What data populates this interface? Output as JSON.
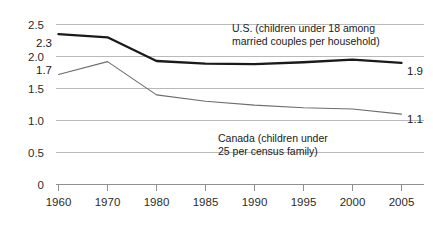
{
  "chart_data": {
    "type": "line",
    "title": "",
    "xlabel": "",
    "ylabel": "",
    "grid": true,
    "legend_position": "inline-annotation",
    "categories": [
      "1960",
      "1970",
      "1980",
      "1985",
      "1990",
      "1995",
      "2000",
      "2005"
    ],
    "x_tick_labels": [
      "1960",
      "1970",
      "1980",
      "1985",
      "1990",
      "1995",
      "2000",
      "2005"
    ],
    "y_tick_labels": [
      "2.5",
      "2.0",
      "1.5",
      "1.0",
      "0.5",
      "0"
    ],
    "y_tick_values": [
      2.5,
      2.0,
      1.5,
      1.0,
      0.5,
      0
    ],
    "ylim": [
      0,
      2.5
    ],
    "series": [
      {
        "name": "U.S. (children under 18 among married couples per household)",
        "short_name": "U.S.",
        "color": "#1a1a1a",
        "values": [
          2.35,
          2.3,
          1.93,
          1.89,
          1.88,
          1.91,
          1.95,
          1.9
        ],
        "start_label": "2.3",
        "end_label": "1.9"
      },
      {
        "name": "Canada (children under 25 per census family)",
        "short_name": "Canada",
        "color": "#6d6d6d",
        "values": [
          1.72,
          1.92,
          1.4,
          1.3,
          1.24,
          1.2,
          1.18,
          1.1
        ],
        "start_label": "1.7",
        "end_label": "1.1"
      }
    ],
    "annotations": [
      {
        "id": "us-annotation",
        "lines": [
          "U.S. (children under 18 among",
          "married couples per household)"
        ]
      },
      {
        "id": "canada-annotation",
        "lines": [
          "Canada (children under",
          "25 per census family)"
        ]
      }
    ]
  }
}
